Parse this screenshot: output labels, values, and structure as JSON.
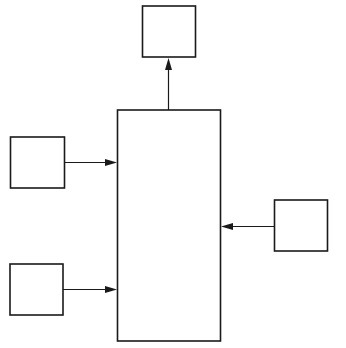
{
  "diagram": {
    "type": "block-diagram",
    "stroke_color": "#1a1a1a",
    "background_color": "#ffffff",
    "nodes": [
      {
        "id": "output-top",
        "label": "",
        "role": "output"
      },
      {
        "id": "central",
        "label": "",
        "role": "process"
      },
      {
        "id": "input-left-upper",
        "label": "",
        "role": "input"
      },
      {
        "id": "input-left-lower",
        "label": "",
        "role": "input"
      },
      {
        "id": "input-right",
        "label": "",
        "role": "input"
      }
    ],
    "edges": [
      {
        "from": "central",
        "to": "output-top",
        "direction": "up",
        "label": ""
      },
      {
        "from": "input-left-upper",
        "to": "central",
        "direction": "right",
        "label": ""
      },
      {
        "from": "input-left-lower",
        "to": "central",
        "direction": "right",
        "label": ""
      },
      {
        "from": "input-right",
        "to": "central",
        "direction": "left",
        "label": ""
      }
    ]
  }
}
